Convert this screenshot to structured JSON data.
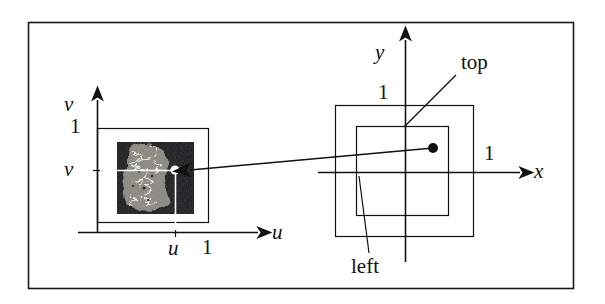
{
  "figure": {
    "border_color": "#1a1a1a",
    "line_color": "#111111",
    "frame": {
      "x": 28,
      "y": 22,
      "width": 545,
      "height": 266
    }
  },
  "uv_panel": {
    "name": "texture-uv-space",
    "axis_u_label": "u",
    "axis_v_label": "v",
    "tick_u_one": "1",
    "tick_v_one": "1",
    "tick_u_value": "u",
    "tick_v_value": "v",
    "unit_square": {
      "x": 97,
      "y": 128,
      "width": 111,
      "height": 94
    },
    "texture_image": {
      "x": 117,
      "y": 142,
      "width": 77,
      "height": 72
    },
    "sample_point": {
      "x": 175,
      "y": 170
    },
    "sample_point_color": "#ffffff",
    "texture_bg_color": "#17171a",
    "texture_blob_color": "#8d8d84",
    "texture_vein_color": "#f2f2ee"
  },
  "xy_panel": {
    "name": "screen-xy-space",
    "axis_x_label": "x",
    "axis_y_label": "y",
    "tick_x_one": "1",
    "tick_y_one": "1",
    "outer_square_label": "top",
    "inner_square_label": "left",
    "outer_square": {
      "x": 335,
      "y": 105,
      "width": 138,
      "height": 131
    },
    "inner_square": {
      "x": 356,
      "y": 126,
      "width": 92,
      "height": 89
    },
    "pixel_point": {
      "x": 433,
      "y": 148
    },
    "pixel_point_color": "#111111",
    "origin": {
      "x": 405,
      "y": 172
    }
  },
  "mapping_arrow": {
    "name": "lookup-arrow",
    "from": {
      "x": 433,
      "y": 148
    },
    "to": {
      "x": 188,
      "y": 170
    }
  },
  "labels": {
    "u": "u",
    "v": "v",
    "x": "x",
    "y": "y",
    "one": "1",
    "top": "top",
    "left": "left"
  }
}
